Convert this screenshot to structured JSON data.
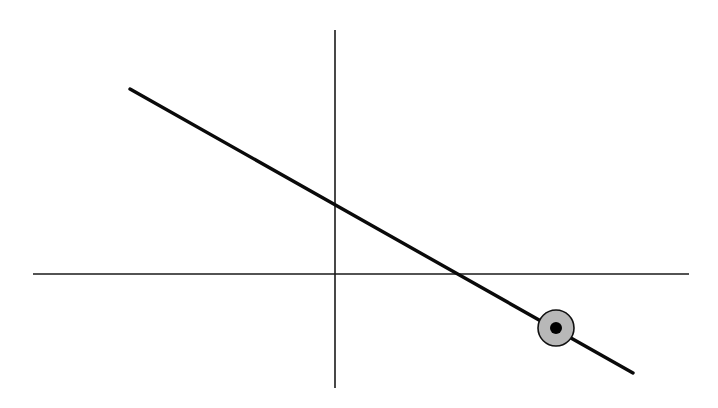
{
  "figure": {
    "colors": {
      "background": "#ffffff",
      "axis": "#1a1a1a",
      "line": "#0a0a0a",
      "point_fill": "#b8b8b8",
      "point_center": "#000000"
    },
    "x_axis": {
      "x1": 33,
      "y1": 274,
      "x2": 689,
      "y2": 274
    },
    "y_axis": {
      "x1": 335,
      "y1": 30,
      "x2": 335,
      "y2": 388
    },
    "line": {
      "x1": 130,
      "y1": 89,
      "x2": 633,
      "y2": 373
    },
    "highlighted_point": {
      "cx": 556,
      "cy": 328,
      "r": 18,
      "inner_r": 6
    }
  }
}
